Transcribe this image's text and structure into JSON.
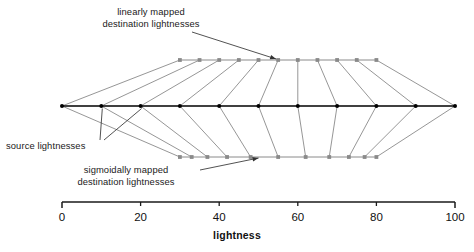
{
  "figure": {
    "axis": {
      "label": "lightness",
      "min": 0,
      "max": 100,
      "ticks": [
        0,
        20,
        40,
        60,
        80,
        100
      ],
      "tick_labels": [
        "0",
        "20",
        "40",
        "60",
        "80",
        "100"
      ],
      "pixel_min_x": 62,
      "pixel_max_x": 455
    },
    "annotations": {
      "linear": {
        "line1": "linearly mapped",
        "line2": "destination lightnesses"
      },
      "source": {
        "line1": "source lightnesses"
      },
      "sigmoidal": {
        "line1": "sigmoidally mapped",
        "line2": "destination lightnesses"
      }
    },
    "colors": {
      "source_line": "#000000",
      "source_marker": "#000000",
      "mapped_line": "#8a8a8a",
      "mapped_marker": "#8a8a8a",
      "connector": "#8a8a8a",
      "annotation_leader": "#333333",
      "axis": "#1a1a1a",
      "text": "#111111",
      "background": "#ffffff"
    }
  },
  "chart_data": {
    "type": "line",
    "title": "",
    "xlabel": "lightness",
    "ylabel": "",
    "xlim": [
      0,
      100
    ],
    "grid": false,
    "legend": "none",
    "categories": [
      0,
      10,
      20,
      30,
      40,
      50,
      60,
      70,
      80,
      90,
      100
    ],
    "series": [
      {
        "name": "source lightnesses",
        "row": "center",
        "y_px": 106,
        "marker": "dot",
        "values": [
          0,
          10,
          20,
          30,
          40,
          50,
          60,
          70,
          80,
          90,
          100
        ]
      },
      {
        "name": "linearly mapped destination lightnesses",
        "row": "top",
        "y_px": 60,
        "marker": "square",
        "values": [
          30,
          35,
          40,
          45,
          50,
          55,
          60,
          65,
          70,
          75,
          80
        ]
      },
      {
        "name": "sigmoidally mapped destination lightnesses",
        "row": "bottom",
        "y_px": 157,
        "marker": "square",
        "values": [
          30,
          33,
          37,
          42,
          48,
          55,
          62,
          68,
          73,
          77,
          80
        ]
      }
    ]
  }
}
